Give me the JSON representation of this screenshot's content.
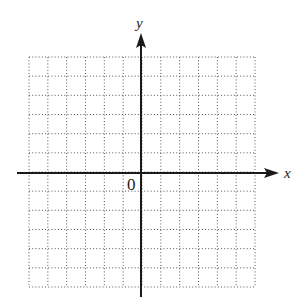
{
  "chart_data": {
    "type": "coordinate-plane",
    "title": "",
    "xlabel": "x",
    "ylabel": "y",
    "origin_label": "0",
    "grid": true,
    "grid_style": "dotted",
    "xlim": [
      -6,
      6
    ],
    "ylim": [
      -6,
      6
    ],
    "x_cells": 12,
    "y_cells": 12,
    "series": []
  },
  "colors": {
    "axis": "#1a1a1a",
    "grid": "#555555",
    "background": "#ffffff"
  },
  "labels": {
    "x_axis": "x",
    "y_axis": "y",
    "origin": "0"
  }
}
